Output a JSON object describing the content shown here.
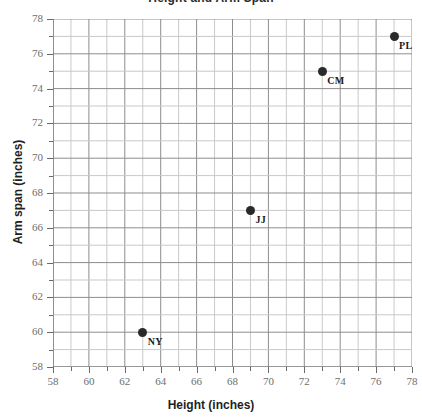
{
  "chart_data": {
    "type": "scatter",
    "title": "Height and Arm Span",
    "xlabel": "Height (inches)",
    "ylabel": "Arm span (inches)",
    "xlim": [
      58,
      78
    ],
    "ylim": [
      58,
      78
    ],
    "xticks": [
      58,
      60,
      62,
      64,
      66,
      68,
      70,
      72,
      74,
      76,
      78
    ],
    "yticks": [
      58,
      60,
      62,
      64,
      66,
      68,
      70,
      72,
      74,
      76,
      78
    ],
    "xtick_labels": [
      "58",
      "60",
      "62",
      "64",
      "66",
      "68",
      "70",
      "72",
      "74",
      "76",
      "78"
    ],
    "ytick_labels": [
      "58",
      "60",
      "62",
      "64",
      "66",
      "68",
      "70",
      "72",
      "74",
      "76",
      "78"
    ],
    "minor_tick_step": 1,
    "grid": true,
    "grid_step": 1,
    "legend": null,
    "points": [
      {
        "label": "NY",
        "x": 63,
        "y": 60
      },
      {
        "label": "JJ",
        "x": 69,
        "y": 67
      },
      {
        "label": "CM",
        "x": 73,
        "y": 75
      },
      {
        "label": "PL",
        "x": 77,
        "y": 77
      }
    ]
  },
  "colors": {
    "point": "#2a2a2a",
    "grid_major": "#8d8d8d",
    "grid_minor": "#c9c9c9",
    "axis": "#6a6a6a",
    "tick_text": "#6e6e6e",
    "axis_title": "#1f1f1f"
  }
}
